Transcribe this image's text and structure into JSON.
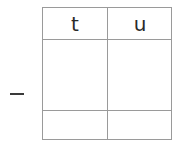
{
  "operator": {
    "symbol": "−",
    "name": "minus"
  },
  "grid": {
    "columns": [
      {
        "key": "t",
        "label": "t"
      },
      {
        "key": "u",
        "label": "u"
      }
    ],
    "rows": [
      {
        "t": "",
        "u": ""
      },
      {
        "t": "",
        "u": ""
      }
    ]
  },
  "colors": {
    "border": "#9a9a9a",
    "text": "#2a2a2a",
    "background": "#ffffff"
  }
}
